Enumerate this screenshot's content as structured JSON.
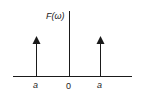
{
  "diagram": {
    "type": "impulse-spectrum",
    "ylabel": "F(ω)",
    "xticks": [
      {
        "label": "a",
        "position": "negative"
      },
      {
        "label": "0",
        "position": "origin"
      },
      {
        "label": "a",
        "position": "positive"
      }
    ],
    "impulses": [
      {
        "at": "-a",
        "direction": "up"
      },
      {
        "at": "a",
        "direction": "up"
      }
    ],
    "colors": {
      "line": "#1a1a1a",
      "background": "#ffffff"
    }
  }
}
